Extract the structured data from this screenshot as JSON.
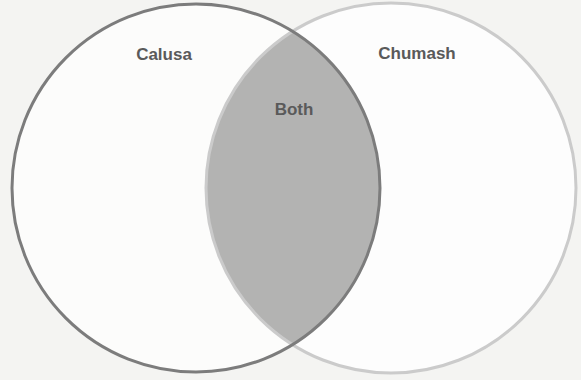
{
  "diagram": {
    "type": "venn",
    "sets": [
      {
        "name": "Calusa",
        "label": "Calusa",
        "color": "#7a7a7a"
      },
      {
        "name": "Chumash",
        "label": "Chumash",
        "color": "#c8c8c8"
      }
    ],
    "intersection": {
      "label": "Both",
      "fill": "#b4b4b4"
    },
    "background": "#f4f4f2"
  }
}
